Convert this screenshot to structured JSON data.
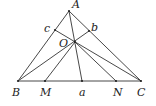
{
  "diagram": {
    "type": "geometry",
    "points": {
      "A": {
        "label": "A",
        "x": 69,
        "y": 11,
        "lx": 72,
        "ly": 8
      },
      "B": {
        "label": "B",
        "x": 18,
        "y": 81,
        "lx": 12,
        "ly": 96
      },
      "C": {
        "label": "C",
        "x": 141,
        "y": 81,
        "lx": 137,
        "ly": 96
      },
      "M": {
        "label": "M",
        "x": 45,
        "y": 81,
        "lx": 40,
        "ly": 96
      },
      "a": {
        "label": "a",
        "x": 82,
        "y": 81,
        "lx": 79,
        "ly": 96
      },
      "N": {
        "label": "N",
        "x": 116,
        "y": 81,
        "lx": 113,
        "ly": 96
      },
      "c": {
        "label": "c",
        "x": 55,
        "y": 30,
        "lx": 44,
        "ly": 32
      },
      "b": {
        "label": "b",
        "x": 89,
        "y": 31,
        "lx": 91,
        "ly": 31
      },
      "O": {
        "label": "O",
        "x": 75,
        "y": 42,
        "lx": 59,
        "ly": 47
      }
    },
    "segments": [
      [
        "A",
        "B"
      ],
      [
        "A",
        "C"
      ],
      [
        "B",
        "C"
      ],
      [
        "A",
        "a"
      ],
      [
        "c",
        "C"
      ],
      [
        "B",
        "b"
      ],
      [
        "O",
        "M"
      ],
      [
        "O",
        "N"
      ]
    ]
  }
}
